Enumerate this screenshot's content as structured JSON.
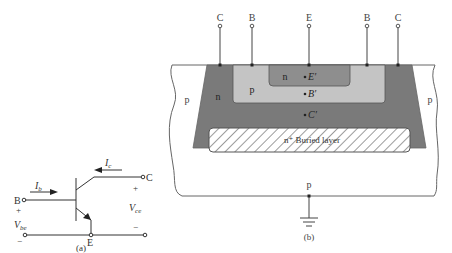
{
  "figure_a": {
    "caption": "(a)",
    "terminals": {
      "base": "B",
      "collector": "C",
      "emitter": "E"
    },
    "currents": {
      "base": "I",
      "base_sub": "b",
      "collector": "I",
      "collector_sub": "c"
    },
    "voltages": {
      "vbe": "V",
      "vbe_sub": "be",
      "vce": "V",
      "vce_sub": "ce"
    },
    "signs": {
      "plus": "+",
      "minus": "−"
    }
  },
  "figure_b": {
    "caption": "(b)",
    "contacts": [
      "C",
      "B",
      "E",
      "B",
      "C"
    ],
    "regions": {
      "substrate_left": "p",
      "substrate_right": "p",
      "substrate_bottom": "p",
      "collector_well": "n",
      "base": "p",
      "emitter": "n",
      "buried_layer": "n⁺ Buried layer"
    },
    "internal_nodes": [
      "E′",
      "B′",
      "C′"
    ],
    "colors": {
      "collector_n": "#7a7a7a",
      "base_p": "#c4c4c4",
      "emitter_n": "#8e8e8e",
      "substrate": "#ffffff",
      "outline": "#555555"
    }
  }
}
